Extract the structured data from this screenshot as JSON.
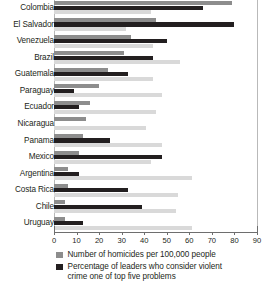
{
  "chart_data": {
    "type": "bar",
    "orientation": "horizontal",
    "title": "",
    "subtitle": "",
    "xlabel": "",
    "ylabel": "",
    "xlim": [
      0,
      90
    ],
    "xticks": [
      0,
      10,
      20,
      30,
      40,
      50,
      60,
      70,
      80,
      90
    ],
    "xtick_labels": [
      "0",
      "10",
      "20",
      "30",
      "40",
      "50",
      "60",
      "70",
      "80",
      "90"
    ],
    "grid": false,
    "legend_position": "bottom",
    "categories": [
      "Colombia",
      "El Salvador",
      "Venezuela",
      "Brazil",
      "Guatemala",
      "Paraguay",
      "Ecuador",
      "Nicaragua",
      "Panama",
      "Mexico",
      "Argentina",
      "Costa Rica",
      "Chile",
      "Uruguay"
    ],
    "series": [
      {
        "name": "Number of homicides per 100,000 people",
        "color": "#8d8d8d",
        "values": [
          79,
          45,
          34,
          31,
          24,
          20,
          16,
          14,
          13,
          11,
          6,
          6,
          5,
          5
        ]
      },
      {
        "name": "Percentage of leaders who consider violent crime one of top five problems",
        "color": "#231f20",
        "values": [
          66,
          80,
          50,
          44,
          33,
          9,
          11,
          0,
          25,
          48,
          11,
          33,
          39,
          13
        ]
      },
      {
        "name": "",
        "color": "#d9d9d9",
        "values": [
          43,
          32,
          44,
          56,
          44,
          48,
          45,
          41,
          48,
          43,
          61,
          55,
          54,
          61
        ]
      }
    ]
  },
  "legend": {
    "items": [
      {
        "swatch": "s0",
        "line1": "Number of homicides per 100,000 people",
        "line2": ""
      },
      {
        "swatch": "s1",
        "line1": "Percentage of leaders who consider violent",
        "line2": "crime one of top five problems"
      }
    ]
  }
}
